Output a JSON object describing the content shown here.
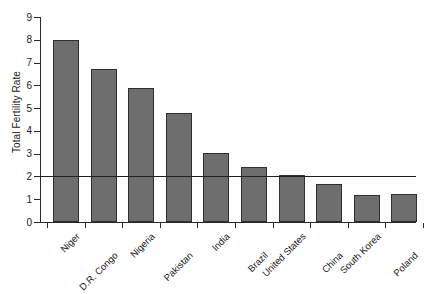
{
  "chart_data": {
    "type": "bar",
    "title": "",
    "subtitle": "",
    "xlabel": "",
    "ylabel": "Total Fertility Rate",
    "categories": [
      "Niger",
      "D.R. Congo",
      "Nigeria",
      "Pakistan",
      "India",
      "Brazil",
      "United States",
      "China",
      "South Korea",
      "Poland"
    ],
    "values": [
      8.0,
      6.7,
      5.9,
      4.8,
      3.05,
      2.4,
      2.05,
      1.65,
      1.2,
      1.25
    ],
    "ylim": [
      0,
      9
    ],
    "ytick_labels": [
      "0",
      "1",
      "2",
      "3",
      "4",
      "5",
      "6",
      "7",
      "8",
      "9"
    ],
    "ytick_values": [
      0,
      1,
      2,
      3,
      4,
      5,
      6,
      7,
      8,
      9
    ],
    "grid": false,
    "legend": null,
    "legend_position": "none",
    "annotations": [
      {
        "name": "replacement-level-line",
        "type": "horizontal-reference-line",
        "value": 2.0,
        "label": ""
      }
    ],
    "series": [
      {
        "name": "Total Fertility Rate",
        "values": [
          8.0,
          6.7,
          5.9,
          4.8,
          3.05,
          2.4,
          2.05,
          1.65,
          1.2,
          1.25
        ]
      }
    ],
    "colors": {
      "bar_fill": "#6e6e6e",
      "bar_border": "#2f2f2f",
      "axis": "#2b2b2b",
      "reference_line": "#1f1f1f",
      "text": "#1a1a1a",
      "background": "#ffffff"
    }
  },
  "axis": {
    "y_title": "Total Fertility Rate"
  }
}
